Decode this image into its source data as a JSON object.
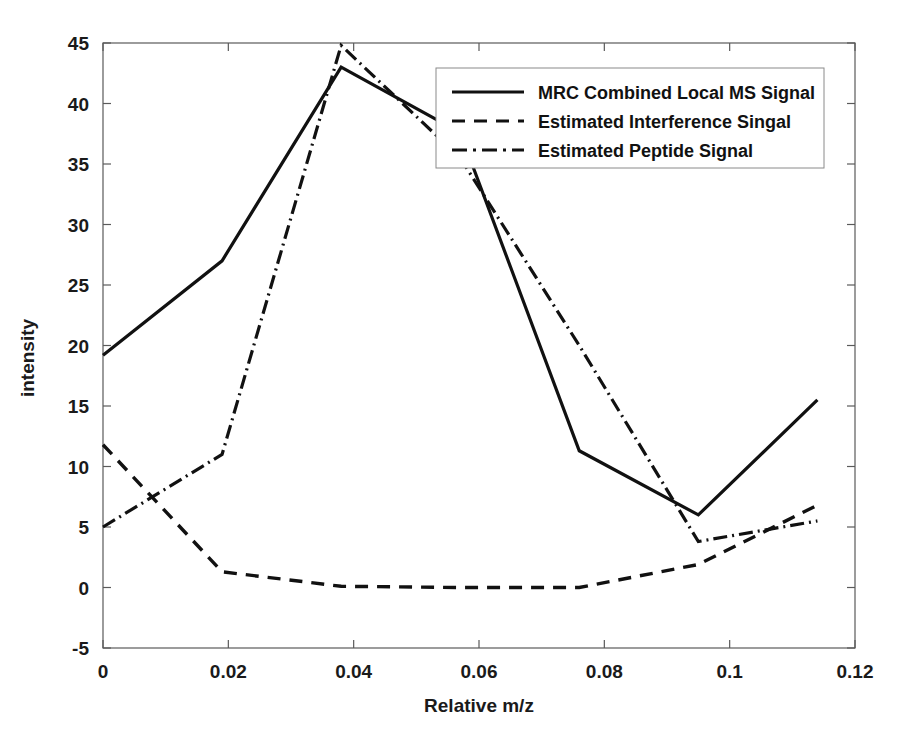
{
  "chart_data": {
    "type": "line",
    "title": "",
    "xlabel": "Relative m/z",
    "ylabel": "intensity",
    "xlim": [
      0,
      0.12
    ],
    "ylim": [
      -5,
      45
    ],
    "grid": false,
    "legend_position": "upper right",
    "xticks": [
      "0",
      "0.02",
      "0.04",
      "0.06",
      "0.08",
      "0.1",
      "0.12"
    ],
    "xtick_values": [
      0,
      0.02,
      0.04,
      0.06,
      0.08,
      0.1,
      0.12
    ],
    "yticks": [
      "-5",
      "0",
      "5",
      "10",
      "15",
      "20",
      "25",
      "30",
      "35",
      "40",
      "45"
    ],
    "ytick_values": [
      -5,
      0,
      5,
      10,
      15,
      20,
      25,
      30,
      35,
      40,
      45
    ],
    "x": [
      0.0,
      0.019,
      0.038,
      0.057,
      0.076,
      0.095,
      0.114
    ],
    "series": [
      {
        "name": "MRC Combined Local MS Signal",
        "style": "solid",
        "color": "#111111",
        "width": 3.2,
        "dasharray": "",
        "values": [
          19.2,
          27.0,
          43.0,
          37.6,
          11.3,
          6.0,
          15.5
        ]
      },
      {
        "name": "Estimated Interference Singal",
        "style": "dashed",
        "color": "#111111",
        "width": 3.4,
        "dasharray": "13,9",
        "values": [
          11.8,
          1.3,
          0.1,
          0.0,
          0.0,
          1.9,
          6.8
        ]
      },
      {
        "name": "Estimated Peptide Signal",
        "style": "dash-dot",
        "color": "#111111",
        "width": 3.2,
        "dasharray": "14,5,2,5",
        "values": [
          5.0,
          11.0,
          44.8,
          35.5,
          20.0,
          3.8,
          5.5
        ]
      }
    ]
  },
  "legend": {
    "entries": [
      {
        "label": "MRC Combined Local MS Signal",
        "style": "solid",
        "dasharray": ""
      },
      {
        "label": "Estimated Interference Singal",
        "style": "dashed",
        "dasharray": "13,9"
      },
      {
        "label": "Estimated Peptide Signal",
        "style": "dash-dot",
        "dasharray": "15,6,3,6"
      }
    ]
  },
  "axes": {
    "x_label": "Relative m/z",
    "y_label": "intensity",
    "x_tick_labels": [
      "0",
      "0.02",
      "0.04",
      "0.06",
      "0.08",
      "0.1",
      "0.12"
    ],
    "y_tick_labels": [
      "45",
      "40",
      "35",
      "30",
      "25",
      "20",
      "15",
      "10",
      "5",
      "0",
      "-5"
    ]
  }
}
